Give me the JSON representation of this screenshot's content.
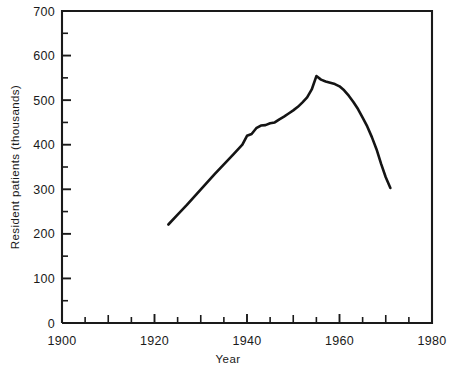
{
  "chart_data": {
    "type": "line",
    "title": "",
    "xlabel": "Year",
    "ylabel": "Resident patients (thousands)",
    "xlim": [
      1900,
      1980
    ],
    "ylim": [
      0,
      700
    ],
    "grid": false,
    "legend": "none",
    "x_ticks_major": [
      1900,
      1920,
      1940,
      1960,
      1980
    ],
    "x_tick_labels": [
      "1900",
      "1920",
      "1940",
      "1960",
      "1980"
    ],
    "x_ticks_minor_step": 5,
    "y_ticks_major": [
      0,
      100,
      200,
      300,
      400,
      500,
      600,
      700
    ],
    "y_tick_labels": [
      "0",
      "100",
      "200",
      "300",
      "400",
      "500",
      "600",
      "700"
    ],
    "y_ticks_minor_step": 50,
    "line_color": "#141414",
    "series": [
      {
        "name": "Resident patients",
        "x": [
          1923,
          1925,
          1927,
          1929,
          1931,
          1933,
          1935,
          1937,
          1939,
          1940,
          1941,
          1942,
          1943,
          1944,
          1945,
          1946,
          1947,
          1948,
          1949,
          1950,
          1951,
          1952,
          1953,
          1954,
          1955,
          1956,
          1957,
          1958,
          1959,
          1960,
          1961,
          1962,
          1963,
          1964,
          1965,
          1966,
          1967,
          1968,
          1969,
          1970,
          1971
        ],
        "y": [
          221,
          243,
          265,
          288,
          311,
          334,
          356,
          378,
          400,
          420,
          424,
          437,
          443,
          444,
          448,
          450,
          457,
          463,
          470,
          477,
          485,
          495,
          506,
          524,
          554,
          546,
          542,
          539,
          536,
          531,
          522,
          510,
          496,
          480,
          461,
          441,
          417,
          390,
          357,
          327,
          303
        ]
      }
    ],
    "annotations": []
  },
  "figure": {
    "plot_left_px": 62,
    "plot_right_px": 432,
    "plot_top_px": 11,
    "plot_bottom_px": 323
  }
}
